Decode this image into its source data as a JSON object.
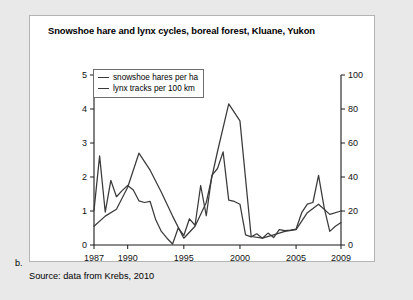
{
  "figure": {
    "label": "b.",
    "source_note": "Source: data from Krebs, 2010"
  },
  "legend": {
    "position": "top-left-inside",
    "entries": [
      {
        "label": "snowshoe hares per ha",
        "icon": "line-swatch-icon"
      },
      {
        "label": "lynx tracks per 100 km",
        "icon": "line-swatch-icon"
      }
    ]
  },
  "colors": {
    "page_background": "#e9e9e9",
    "panel_background": "#ffffff",
    "panel_border": "#b4b4b4",
    "axis": "#1a1a1a",
    "series_line": "#3a3a3a"
  },
  "chart_data": {
    "type": "line",
    "title": "Snowshoe hare and lynx cycles, boreal forest, Kluane, Yukon",
    "xlabel": "",
    "ylabel": "",
    "grid": false,
    "legend_position": "upper left",
    "x": [
      1987,
      1988,
      1989,
      1990,
      1991,
      1992,
      1993,
      1994,
      1995,
      1996,
      1997,
      1998,
      1999,
      2000,
      2001,
      2002,
      2003,
      2004,
      2005,
      2006,
      2007,
      2008,
      2009
    ],
    "xlim": [
      1987,
      2009
    ],
    "xticks": [
      1987,
      1990,
      1995,
      2000,
      2005,
      2009
    ],
    "xtick_labels": [
      "1987",
      "1990",
      "1995",
      "2000",
      "2005",
      "2009"
    ],
    "axes": [
      {
        "side": "left",
        "name": "snowshoe hares per ha",
        "ylim": [
          0,
          5
        ],
        "yticks": [
          0,
          1,
          2,
          3,
          4,
          5
        ],
        "ytick_labels": [
          "0",
          "1",
          "2",
          "3",
          "4",
          "5"
        ]
      },
      {
        "side": "right",
        "name": "lynx tracks per 100 km",
        "ylim": [
          0,
          100
        ],
        "yticks": [
          0,
          20,
          40,
          60,
          80,
          100
        ],
        "ytick_labels": [
          "0",
          "20",
          "40",
          "60",
          "80",
          "100"
        ]
      }
    ],
    "series": [
      {
        "name": "snowshoe hares per ha",
        "axis": "left",
        "unit": "hares per ha",
        "x": [
          1987,
          1987.5,
          1988,
          1988.5,
          1989,
          1989.5,
          1990,
          1990.5,
          1991,
          1991.5,
          1992,
          1992.5,
          1993,
          1993.5,
          1994,
          1994.5,
          1995,
          1995.5,
          1996,
          1996.5,
          1997,
          1997.5,
          1998,
          1998.5,
          1999,
          1999.5,
          2000,
          2000.5,
          2001,
          2001.5,
          2002,
          2002.5,
          2003,
          2003.5,
          2004,
          2004.5,
          2005,
          2005.5,
          2006,
          2006.5,
          2007,
          2007.5,
          2008,
          2008.5,
          2009
        ],
        "values": [
          1.02,
          2.62,
          0.97,
          1.9,
          1.42,
          1.6,
          1.75,
          1.62,
          1.3,
          1.25,
          1.28,
          0.74,
          0.4,
          0.2,
          0.03,
          0.5,
          0.28,
          0.77,
          0.58,
          1.75,
          0.86,
          2.05,
          2.25,
          2.74,
          1.32,
          1.28,
          1.2,
          0.3,
          0.24,
          0.33,
          0.2,
          0.35,
          0.22,
          0.45,
          0.42,
          0.44,
          0.47,
          0.95,
          1.2,
          1.25,
          2.05,
          1.1,
          0.4,
          0.55,
          0.66
        ]
      },
      {
        "name": "lynx tracks per 100 km",
        "axis": "right",
        "unit": "tracks per 100 km",
        "x": [
          1987,
          1988,
          1989,
          1990,
          1991,
          1992,
          1993,
          1994,
          1995,
          1996,
          1997,
          1998,
          1999,
          2000,
          2001,
          2002,
          2003,
          2004,
          2005,
          2006,
          2007,
          2008,
          2009
        ],
        "values": [
          11,
          17,
          21,
          34,
          54,
          44,
          31,
          17,
          4,
          11,
          25,
          55,
          83,
          73,
          5,
          4,
          6,
          8,
          9,
          19,
          24,
          18,
          20
        ]
      }
    ],
    "annotations": []
  }
}
